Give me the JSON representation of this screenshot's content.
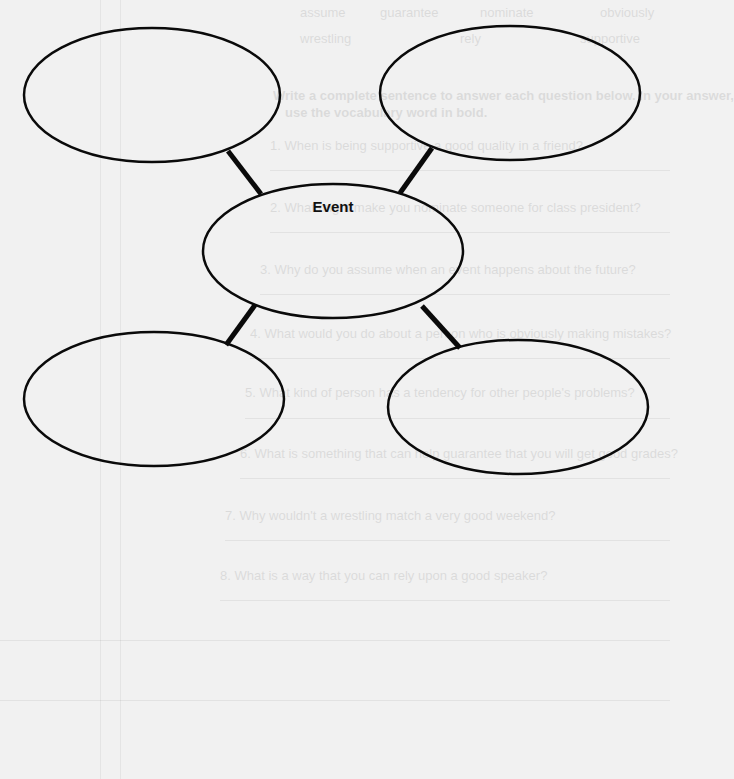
{
  "organizer": {
    "center": {
      "label": "Event",
      "cx": 333,
      "cy": 251,
      "rx": 130,
      "ry": 67
    },
    "bubbles": [
      {
        "id": "top-left",
        "cx": 152,
        "cy": 95,
        "rx": 128,
        "ry": 67,
        "text": ""
      },
      {
        "id": "top-right",
        "cx": 510,
        "cy": 93,
        "rx": 130,
        "ry": 67,
        "text": ""
      },
      {
        "id": "bottom-left",
        "cx": 154,
        "cy": 399,
        "rx": 130,
        "ry": 67,
        "text": ""
      },
      {
        "id": "bottom-right",
        "cx": 518,
        "cy": 407,
        "rx": 130,
        "ry": 67,
        "text": ""
      }
    ],
    "connectors": [
      {
        "from": "top-left",
        "x1": 228,
        "y1": 151,
        "x2": 261,
        "y2": 194
      },
      {
        "from": "top-right",
        "x1": 432,
        "y1": 148,
        "x2": 400,
        "y2": 193
      },
      {
        "from": "bottom-left",
        "x1": 226,
        "y1": 345,
        "x2": 255,
        "y2": 305
      },
      {
        "from": "bottom-right",
        "x1": 460,
        "y1": 348,
        "x2": 422,
        "y2": 306
      }
    ],
    "stroke_color": "#000000",
    "paper_color": "#f1f1f1"
  },
  "show_through": {
    "word_bank_row1": [
      "assume",
      "guarantee",
      "nominate",
      "obviously"
    ],
    "word_bank_row2": [
      "wrestling",
      "rely",
      "supportive"
    ],
    "instructions_line1": "Write a complete sentence to answer each question below. In your answer,",
    "instructions_line2": "use the vocabulary word in bold.",
    "questions": [
      "1. When is being supportive a good quality in a friend?",
      "2. What might make you nominate someone for class president?",
      "3. Why do you assume when an event happens about the future?",
      "4. What would you do about a person who is obviously making mistakes?",
      "5. What kind of person has a tendency for other people's problems?",
      "6. What is something that can help guarantee that you will get good grades?",
      "7. Why wouldn't a wrestling match a very good weekend?",
      "8. What is a way that you can rely upon a good speaker?"
    ]
  }
}
